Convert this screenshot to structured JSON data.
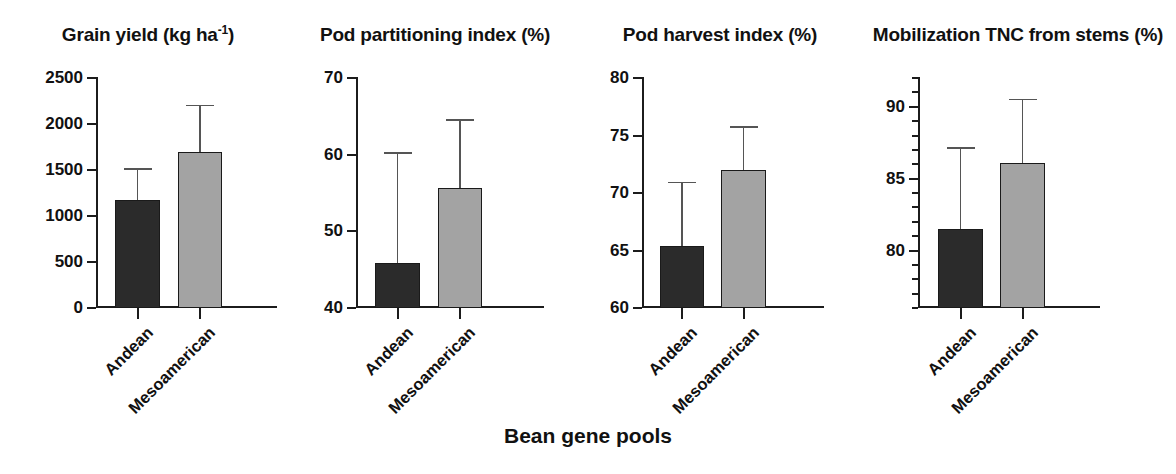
{
  "figure": {
    "x_axis_title": "Bean gene pools",
    "categories": [
      "Andean",
      "Mesoamerican"
    ],
    "series_colors": {
      "andean": "#2b2b2b",
      "mesoamerican": "#a3a3a3"
    },
    "errorbar_style": "upper-only-SD"
  },
  "chart_data": [
    {
      "type": "bar",
      "title": "Grain yield (kg ha",
      "title_superscript": "-1",
      "title_suffix": ")",
      "title_full": "Grain yield (kg ha-1)",
      "xlabel": "Bean gene pools",
      "ylabel": "",
      "categories": [
        "Andean",
        "Mesoamerican"
      ],
      "values": [
        1160,
        1690
      ],
      "errors_upper": [
        1510,
        2200
      ],
      "ylim": [
        0,
        2500
      ],
      "yticks": [
        0,
        500,
        1000,
        1500,
        2000,
        2500
      ],
      "ytick_labels": [
        "0",
        "500",
        "1000",
        "1500",
        "2000",
        "2500"
      ],
      "minor_ticks": false,
      "grid": false,
      "legend": "none"
    },
    {
      "type": "bar",
      "title": "Pod partitioning index (%)",
      "title_superscript": "",
      "title_suffix": "",
      "title_full": "Pod partitioning index (%)",
      "xlabel": "Bean gene pools",
      "ylabel": "",
      "categories": [
        "Andean",
        "Mesoamerican"
      ],
      "values": [
        45.8,
        55.5
      ],
      "errors_upper": [
        60.2,
        64.5
      ],
      "ylim": [
        40,
        70
      ],
      "yticks": [
        40,
        50,
        60,
        70
      ],
      "ytick_labels": [
        "40",
        "50",
        "60",
        "70"
      ],
      "minor_ticks": false,
      "grid": false,
      "legend": "none"
    },
    {
      "type": "bar",
      "title": "Pod harvest index (%)",
      "title_superscript": "",
      "title_suffix": "",
      "title_full": "Pod harvest index (%)",
      "xlabel": "Bean gene pools",
      "ylabel": "",
      "categories": [
        "Andean",
        "Mesoamerican"
      ],
      "values": [
        65.3,
        71.9
      ],
      "errors_upper": [
        70.9,
        75.7
      ],
      "ylim": [
        60,
        80
      ],
      "yticks": [
        60,
        65,
        70,
        75,
        80
      ],
      "ytick_labels": [
        "60",
        "65",
        "70",
        "75",
        "80"
      ],
      "minor_ticks": false,
      "grid": false,
      "legend": "none"
    },
    {
      "type": "bar",
      "title": "Mobilization TNC from stems (%)",
      "title_superscript": "",
      "title_suffix": "",
      "title_full": "Mobilization TNC from stems (%)",
      "xlabel": "Bean gene pools",
      "ylabel": "",
      "categories": [
        "Andean",
        "Mesoamerican"
      ],
      "values": [
        81.4,
        86.0
      ],
      "errors_upper": [
        87.1,
        90.5
      ],
      "ylim": [
        76,
        92
      ],
      "yticks": [
        80,
        85,
        90
      ],
      "ytick_labels": [
        "80",
        "85",
        "90"
      ],
      "minor_ticks": true,
      "minor_tick_step": 1,
      "grid": false,
      "legend": "none"
    }
  ]
}
